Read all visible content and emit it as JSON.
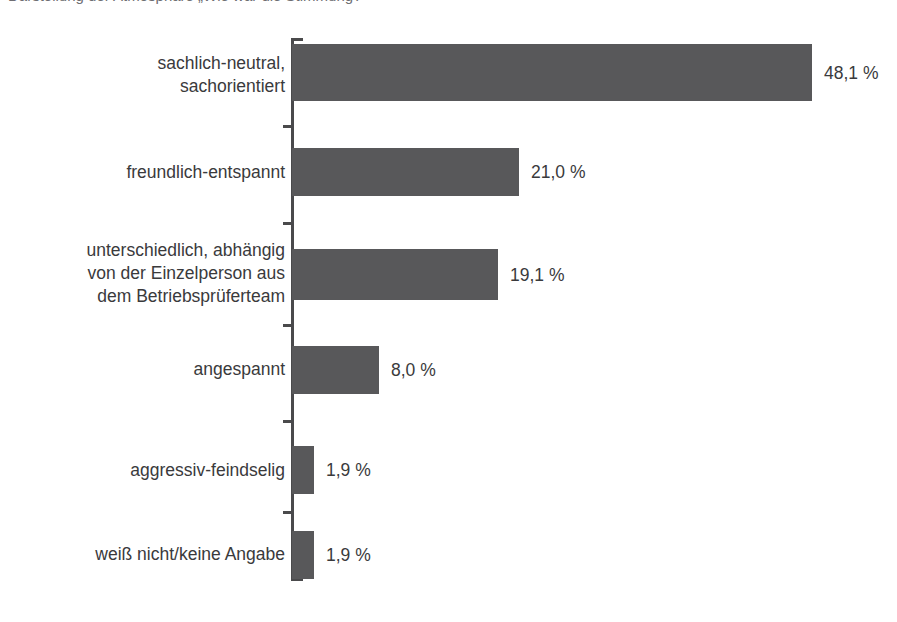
{
  "chart_data": {
    "type": "bar",
    "orientation": "horizontal",
    "title": "Darstellung der Atmosphäre „Wie war die Stimmung?\"",
    "title_truncated": true,
    "xlabel": "",
    "ylabel": "",
    "unit": "%",
    "value_suffix": " %",
    "decimal_separator": ",",
    "grid": false,
    "legend": false,
    "xlim": [
      0,
      48.1
    ],
    "categories": [
      "sachlich-neutral,\nsachorientiert",
      "freundlich-entspannt",
      "unterschiedlich, abhängig\nvon der Einzelperson aus\ndem Betriebsprüferteam",
      "angespannt",
      "aggressiv-feindselig",
      "weiß nicht/keine Angabe"
    ],
    "values": [
      48.1,
      21.0,
      19.1,
      8.0,
      1.9,
      1.9
    ],
    "value_labels": [
      "48,1 %",
      "21,0 %",
      "19,1 %",
      "8,0 %",
      "1,9 %",
      "1,9 %"
    ],
    "colors": {
      "bar": "#58585a",
      "axis": "#4a4a4c",
      "text": "#3a3a3c",
      "background": "#ffffff"
    }
  },
  "rows": [
    {
      "label": "sachlich-neutral,\nsachorientiert",
      "value_label": "48,1 %",
      "value": 48.1,
      "top": 44,
      "height": 57,
      "width": 520,
      "label_top": 52,
      "value_left": 824,
      "value_top": 63
    },
    {
      "label": "freundlich-entspannt",
      "value_label": "21,0 %",
      "value": 21.0,
      "top": 148,
      "height": 48,
      "width": 227,
      "label_top": 161,
      "value_left": 531,
      "value_top": 162
    },
    {
      "label": "unterschiedlich, abhängig\nvon der Einzelperson aus\ndem Betriebsprüferteam",
      "value_label": "19,1 %",
      "value": 19.1,
      "top": 249,
      "height": 51,
      "width": 206,
      "label_top": 239,
      "value_left": 510,
      "value_top": 265
    },
    {
      "label": "angespannt",
      "value_label": "8,0 %",
      "value": 8.0,
      "top": 346,
      "height": 48,
      "width": 87,
      "label_top": 358,
      "value_left": 391,
      "value_top": 360
    },
    {
      "label": "aggressiv-feindselig",
      "value_label": "1,9 %",
      "value": 1.9,
      "top": 446,
      "height": 48,
      "width": 22,
      "label_top": 459,
      "value_left": 326,
      "value_top": 460
    },
    {
      "label": "weiß nicht/keine Angabe",
      "value_label": "1,9 %",
      "value": 1.9,
      "top": 531,
      "height": 48,
      "width": 22,
      "label_top": 543,
      "value_left": 326,
      "value_top": 545
    }
  ],
  "axis": {
    "ticks": [
      {
        "top": 125
      },
      {
        "top": 222
      },
      {
        "top": 324
      },
      {
        "top": 420
      },
      {
        "top": 511
      }
    ]
  }
}
